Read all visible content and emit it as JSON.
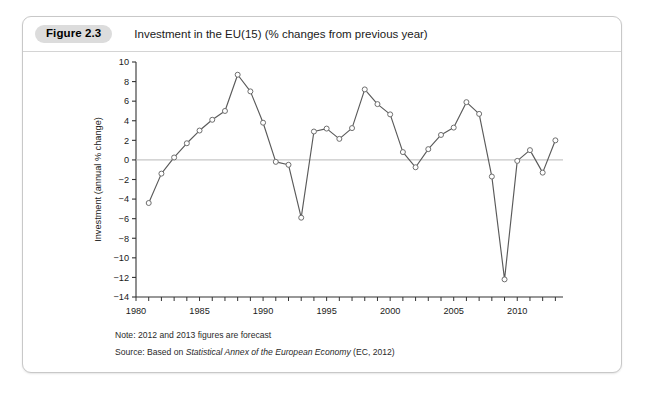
{
  "figure": {
    "badge": "Figure 2.3",
    "title": "Investment in the EU(15) (% changes from previous year)"
  },
  "footnotes": {
    "note_label": "Note: 2012 and 2013 figures are forecast",
    "source_prefix": "Source: Based on ",
    "source_italic": "Statistical Annex of the European Economy",
    "source_suffix": " (EC, 2012)"
  },
  "colors": {
    "line": "#5a5a5a",
    "marker_fill": "#ffffff",
    "marker_stroke": "#6e6e6e",
    "zero_line": "#b9b9b9",
    "axis": "#333333",
    "card_border": "#c8c8c8",
    "badge_bg": "#dcdcdc"
  },
  "chart_data": {
    "type": "line",
    "title": "Investment in the EU(15) (% changes from previous year)",
    "xlabel": "",
    "ylabel": "Investment (annual % change)",
    "xlim": [
      1980,
      2013.6
    ],
    "ylim": [
      -14,
      10
    ],
    "ytick_step": 2,
    "yticks": [
      -14,
      -12,
      -10,
      -8,
      -6,
      -4,
      -2,
      0,
      2,
      4,
      6,
      8,
      10
    ],
    "ytick_labels": [
      "−14",
      "−12",
      "−10",
      "−8",
      "−6",
      "−4",
      "−2",
      "0",
      "2",
      "4",
      "6",
      "8",
      "10"
    ],
    "xticks": [
      1980,
      1981,
      1982,
      1983,
      1984,
      1985,
      1986,
      1987,
      1988,
      1989,
      1990,
      1991,
      1992,
      1993,
      1994,
      1995,
      1996,
      1997,
      1998,
      1999,
      2000,
      2001,
      2002,
      2003,
      2004,
      2005,
      2006,
      2007,
      2008,
      2009,
      2010,
      2011,
      2012,
      2013
    ],
    "xtick_labels_shown": [
      1980,
      1985,
      1990,
      1995,
      2000,
      2005,
      2010
    ],
    "xtick_label_text": [
      "1980",
      "1985",
      "1990",
      "1995",
      "2000",
      "2005",
      "2010"
    ],
    "grid": false,
    "legend": false,
    "zero_line": true,
    "markers": "open-circle",
    "x": [
      1981,
      1982,
      1983,
      1984,
      1985,
      1986,
      1987,
      1988,
      1989,
      1990,
      1991,
      1992,
      1993,
      1994,
      1995,
      1996,
      1997,
      1998,
      1999,
      2000,
      2001,
      2002,
      2003,
      2004,
      2005,
      2006,
      2007,
      2008,
      2009,
      2010,
      2011,
      2012,
      2013
    ],
    "values": [
      -4.4,
      -1.4,
      0.25,
      1.7,
      3.0,
      4.1,
      5.0,
      8.7,
      7.0,
      3.8,
      -0.2,
      -0.5,
      -5.9,
      2.9,
      3.2,
      2.15,
      3.25,
      7.2,
      5.7,
      4.65,
      0.8,
      -0.75,
      1.1,
      2.55,
      3.3,
      5.9,
      4.7,
      -1.7,
      -12.2,
      -0.1,
      1.0,
      -1.3,
      2.0
    ],
    "series": [
      {
        "name": "Investment (annual % change)",
        "values": [
          -4.4,
          -1.4,
          0.25,
          1.7,
          3.0,
          4.1,
          5.0,
          8.7,
          7.0,
          3.8,
          -0.2,
          -0.5,
          -5.9,
          2.9,
          3.2,
          2.15,
          3.25,
          7.2,
          5.7,
          4.65,
          0.8,
          -0.75,
          1.1,
          2.55,
          3.3,
          5.9,
          4.7,
          -1.7,
          -12.2,
          -0.1,
          1.0,
          -1.3,
          2.0
        ]
      }
    ]
  }
}
